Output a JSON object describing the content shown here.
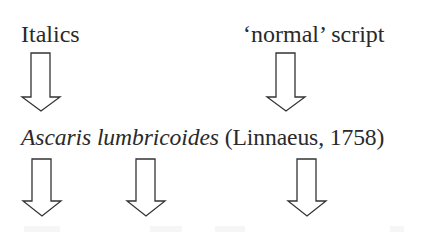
{
  "diagram": {
    "top_labels": {
      "left": "Italics",
      "right": "‘normal’ script"
    },
    "species_name": {
      "genus": "Ascaris",
      "species": "lumbricoides",
      "authority": "(Linnaeus, 1758)"
    },
    "arrows": [
      {
        "id": "italics-to-genus",
        "tip_x": 41,
        "top_y": 53,
        "tip_y": 111
      },
      {
        "id": "normal-to-authority",
        "tip_x": 286,
        "top_y": 53,
        "tip_y": 111
      },
      {
        "id": "genus-down",
        "tip_x": 42,
        "top_y": 159,
        "tip_y": 216
      },
      {
        "id": "species-down",
        "tip_x": 146,
        "top_y": 159,
        "tip_y": 216
      },
      {
        "id": "authority-down",
        "tip_x": 307,
        "top_y": 159,
        "tip_y": 216
      }
    ],
    "colors": {
      "text": "#2a2a2a",
      "arrow_stroke": "#333333",
      "background": "#ffffff"
    }
  }
}
